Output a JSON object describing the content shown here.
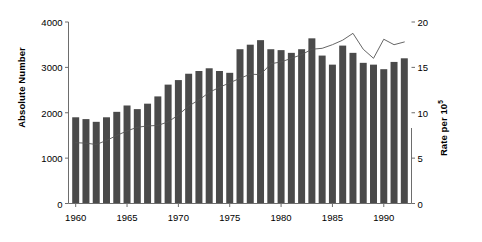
{
  "chart_data": {
    "type": "bar",
    "title": "",
    "subtitle": "",
    "xlabel": "",
    "ylabel": "Absolute Number",
    "ylabel_right_prefix": "Rate per 10",
    "ylabel_right_exponent": "5",
    "grid": false,
    "legend": "none",
    "xlim": [
      1959.3,
      1992.7
    ],
    "ylim": [
      0,
      4000
    ],
    "ylim_right": [
      0,
      20
    ],
    "yticks": [
      0,
      1000,
      2000,
      3000,
      4000
    ],
    "ytick_labels": [
      "0",
      "1000",
      "2000",
      "3000",
      "4000"
    ],
    "yticks_right": [
      0,
      5,
      10,
      15,
      20
    ],
    "ytick_labels_right": [
      "0",
      "5",
      "10",
      "15",
      "20"
    ],
    "xticks": [
      1960,
      1965,
      1970,
      1975,
      1980,
      1985,
      1990
    ],
    "xtick_labels": [
      "1960",
      "1965",
      "1970",
      "1975",
      "1980",
      "1985",
      "1990"
    ],
    "categories": [
      1960,
      1961,
      1962,
      1963,
      1964,
      1965,
      1966,
      1967,
      1968,
      1969,
      1970,
      1971,
      1972,
      1973,
      1974,
      1975,
      1976,
      1977,
      1978,
      1979,
      1980,
      1981,
      1982,
      1983,
      1984,
      1985,
      1986,
      1987,
      1988,
      1989,
      1990,
      1991,
      1992
    ],
    "series": [
      {
        "name": "Rate per 10^5",
        "plot_type": "bar",
        "axis": "right",
        "color": "#4a4a4a",
        "values": [
          9.5,
          9.3,
          9.0,
          9.5,
          10.1,
          10.8,
          10.4,
          11.0,
          11.8,
          13.1,
          13.6,
          14.3,
          14.6,
          14.9,
          14.6,
          14.4,
          17.0,
          17.5,
          18.0,
          17.0,
          16.9,
          16.6,
          17.0,
          18.2,
          16.3,
          15.3,
          17.4,
          16.6,
          15.5,
          15.3,
          14.8,
          15.6,
          16.0
        ]
      },
      {
        "name": "Absolute Number",
        "plot_type": "line",
        "axis": "left",
        "color": "#555555",
        "values": [
          1340,
          1330,
          1300,
          1390,
          1500,
          1600,
          1680,
          1710,
          1720,
          1800,
          1950,
          2150,
          2280,
          2450,
          2560,
          2660,
          2760,
          2850,
          2840,
          3080,
          3120,
          3200,
          3280,
          3400,
          3420,
          3500,
          3600,
          3750,
          3400,
          3200,
          3620,
          3500,
          3560
        ]
      }
    ]
  }
}
